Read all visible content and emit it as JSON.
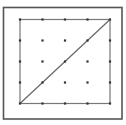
{
  "diagram": {
    "type": "geoboard",
    "background_color": "#ffffff",
    "outer_frame": {
      "x": 3.5,
      "y": 7.5,
      "width": 118.5,
      "height": 111.5,
      "stroke": "#555555",
      "stroke_width": 1.6
    },
    "inner_square": {
      "x": 20,
      "y": 19.5,
      "width": 90,
      "height": 84,
      "stroke": "#777777",
      "stroke_width": 1.2
    },
    "grid": {
      "columns": 5,
      "rows": 5,
      "x_positions": [
        20,
        42.5,
        65,
        87.5,
        110
      ],
      "y_positions": [
        19.5,
        40.5,
        61.5,
        82.5,
        103.5
      ],
      "dot_size": 2.2,
      "dot_color": "#333333"
    },
    "diagonal": {
      "from": {
        "x": 20,
        "y": 103.5
      },
      "to": {
        "x": 110,
        "y": 19.5
      },
      "stroke": "#666666",
      "stroke_width": 1.2,
      "description": "Diagonal from bottom-left corner to top-right corner of inner square"
    }
  }
}
